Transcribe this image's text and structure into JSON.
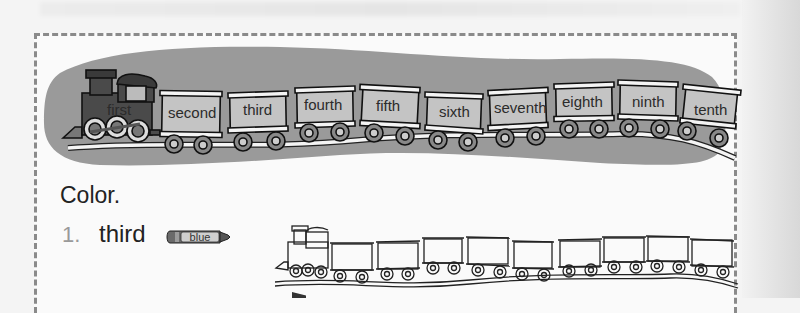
{
  "worksheet": {
    "banner": {
      "cars": [
        {
          "label": "first",
          "type": "engine"
        },
        {
          "label": "second",
          "type": "car"
        },
        {
          "label": "third",
          "type": "car"
        },
        {
          "label": "fourth",
          "type": "car"
        },
        {
          "label": "fifth",
          "type": "car"
        },
        {
          "label": "sixth",
          "type": "car"
        },
        {
          "label": "seventh",
          "type": "car"
        },
        {
          "label": "eighth",
          "type": "car"
        },
        {
          "label": "ninth",
          "type": "car"
        },
        {
          "label": "tenth",
          "type": "car"
        }
      ]
    },
    "instructions": "Color.",
    "items": [
      {
        "number": "1.",
        "word": "third",
        "crayon_color_label": "blue",
        "train_cars_count": 10
      }
    ],
    "colors": {
      "blob": "#9a9a9a",
      "engine": "#4a4a4a",
      "car_fill": "#c4c4c4",
      "frame_border": "#8a8a8a",
      "crayon": "#6a6a6a"
    }
  }
}
